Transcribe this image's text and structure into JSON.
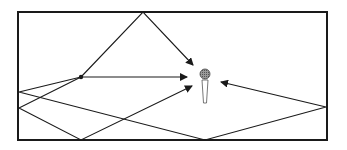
{
  "diagram": {
    "title": "",
    "colors": {
      "stroke": "#1a1a1a",
      "background": "#ffffff",
      "mic_head": "#888888",
      "mic_body": "#ffffff"
    },
    "room": {
      "x": 18,
      "y": 12,
      "width": 309,
      "height": 128
    },
    "source": {
      "x": 81,
      "y": 77
    },
    "microphone": {
      "x": 205,
      "y": 74
    },
    "paths": [
      {
        "name": "direct-path",
        "points": [
          [
            81,
            77
          ],
          [
            187,
            77
          ]
        ],
        "arrow": true
      },
      {
        "name": "ceiling-reflection",
        "points": [
          [
            81,
            77
          ],
          [
            143,
            12
          ],
          [
            193,
            65
          ]
        ],
        "arrow": true
      },
      {
        "name": "left-bottom-reflection",
        "points": [
          [
            81,
            77
          ],
          [
            19,
            108
          ],
          [
            81,
            140
          ],
          [
            192,
            86
          ]
        ],
        "arrow": true
      },
      {
        "name": "left-bottom-right-reflection",
        "points": [
          [
            81,
            77
          ],
          [
            19,
            92
          ],
          [
            205,
            140
          ],
          [
            326,
            107
          ],
          [
            221,
            82
          ]
        ],
        "arrow": true
      }
    ]
  }
}
